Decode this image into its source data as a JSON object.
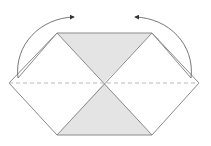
{
  "diagram": {
    "type": "origami-fold-step",
    "colors": {
      "background": "#ffffff",
      "outline": "#8a8a8a",
      "shade": "#e4e4e4",
      "dashed_line": "#b8b8b8",
      "arrow": "#555555"
    },
    "shapes": {
      "hexagon": [
        [
          57,
          33
        ],
        [
          152,
          33
        ],
        [
          199,
          83
        ],
        [
          152,
          135
        ],
        [
          57,
          135
        ],
        [
          9,
          83
        ]
      ],
      "top_triangle": [
        [
          57,
          33
        ],
        [
          152,
          33
        ],
        [
          104,
          83
        ]
      ],
      "bottom_triangle": [
        [
          57,
          135
        ],
        [
          152,
          135
        ],
        [
          104,
          83
        ]
      ],
      "fold_line": [
        [
          9,
          83
        ],
        [
          199,
          83
        ]
      ]
    },
    "arrows": [
      {
        "name": "left-fold-arrow",
        "from": [
          18,
          78
        ],
        "to": [
          74,
          17
        ]
      },
      {
        "name": "right-fold-arrow",
        "from": [
          191,
          78
        ],
        "to": [
          135,
          17
        ]
      }
    ]
  }
}
